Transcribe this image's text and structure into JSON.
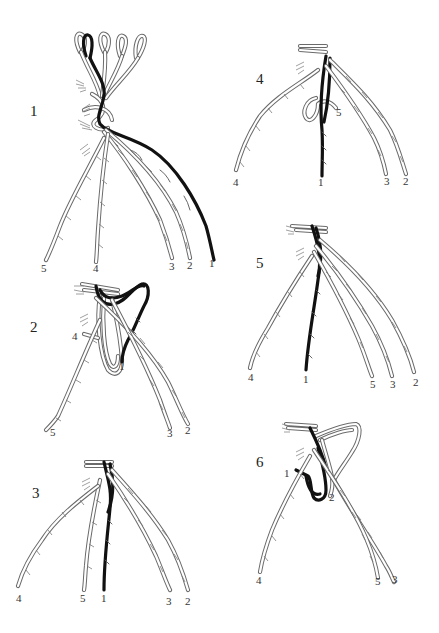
{
  "figure": {
    "colors": {
      "light_strand": "#6a6a6a",
      "dark_strand": "#111111",
      "background": "#ffffff",
      "text": "#222222"
    },
    "panels": [
      {
        "step": "1",
        "strand_labels": [
          {
            "id": "5",
            "x": 44,
            "y": 270
          },
          {
            "id": "4",
            "x": 96,
            "y": 270
          },
          {
            "id": "3",
            "x": 172,
            "y": 267
          },
          {
            "id": "2",
            "x": 190,
            "y": 267
          },
          {
            "id": "1",
            "x": 212,
            "y": 265
          }
        ]
      },
      {
        "step": "2",
        "strand_labels": [
          {
            "id": "4",
            "x": 76,
            "y": 337
          },
          {
            "id": "1",
            "x": 122,
            "y": 369
          },
          {
            "id": "5",
            "x": 52,
            "y": 434
          },
          {
            "id": "3",
            "x": 171,
            "y": 436
          },
          {
            "id": "2",
            "x": 188,
            "y": 432
          }
        ]
      },
      {
        "step": "3",
        "strand_labels": [
          {
            "id": "4",
            "x": 20,
            "y": 600
          },
          {
            "id": "5",
            "x": 84,
            "y": 600
          },
          {
            "id": "1",
            "x": 104,
            "y": 600
          },
          {
            "id": "3",
            "x": 170,
            "y": 604
          },
          {
            "id": "2",
            "x": 189,
            "y": 604
          }
        ]
      },
      {
        "step": "4",
        "strand_labels": [
          {
            "id": "5",
            "x": 339,
            "y": 114
          },
          {
            "id": "4",
            "x": 236,
            "y": 185
          },
          {
            "id": "1",
            "x": 321,
            "y": 185
          },
          {
            "id": "3",
            "x": 387,
            "y": 184
          },
          {
            "id": "2",
            "x": 406,
            "y": 184
          }
        ]
      },
      {
        "step": "5",
        "strand_labels": [
          {
            "id": "4",
            "x": 251,
            "y": 379
          },
          {
            "id": "1",
            "x": 306,
            "y": 382
          },
          {
            "id": "5",
            "x": 373,
            "y": 387
          },
          {
            "id": "3",
            "x": 394,
            "y": 387
          },
          {
            "id": "2",
            "x": 417,
            "y": 385
          }
        ]
      },
      {
        "step": "6",
        "strand_labels": [
          {
            "id": "1",
            "x": 287,
            "y": 475
          },
          {
            "id": "2",
            "x": 332,
            "y": 500
          },
          {
            "id": "4",
            "x": 259,
            "y": 581
          },
          {
            "id": "5",
            "x": 378,
            "y": 582
          },
          {
            "id": "3",
            "x": 395,
            "y": 580
          }
        ]
      }
    ]
  },
  "labels": {
    "p1": {
      "step": "1",
      "s5": "5",
      "s4": "4",
      "s3": "3",
      "s2": "2",
      "s1": "1"
    },
    "p2": {
      "step": "2",
      "s4": "4",
      "s1": "1",
      "s5": "5",
      "s3": "3",
      "s2": "2"
    },
    "p3": {
      "step": "3",
      "s4": "4",
      "s5": "5",
      "s1": "1",
      "s3": "3",
      "s2": "2"
    },
    "p4": {
      "step": "4",
      "s5": "5",
      "s4": "4",
      "s1": "1",
      "s3": "3",
      "s2": "2"
    },
    "p5": {
      "step": "5",
      "s4": "4",
      "s1": "1",
      "s5": "5",
      "s3": "3",
      "s2": "2"
    },
    "p6": {
      "step": "6",
      "s1": "1",
      "s2": "2",
      "s4": "4",
      "s5": "5",
      "s3": "3"
    }
  }
}
